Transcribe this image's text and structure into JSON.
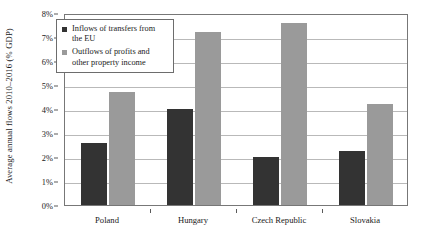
{
  "chart_data": {
    "type": "bar",
    "title": "",
    "xlabel": "",
    "ylabel": "Average annual flows 2010–2016 (% GDP)",
    "categories": [
      "Poland",
      "Hungary",
      "Czech Republic",
      "Slovakia"
    ],
    "series": [
      {
        "name": "Inflows of transfers from the EU",
        "color": "#333333",
        "values": [
          2.6,
          4.0,
          2.0,
          2.25
        ]
      },
      {
        "name": "Outflows of profits and other property income",
        "color": "#9a9a9a",
        "values": [
          4.7,
          7.2,
          7.6,
          4.2
        ]
      }
    ],
    "ylim": [
      0,
      8
    ],
    "ytick_values": [
      0,
      1,
      2,
      3,
      4,
      5,
      6,
      7,
      8
    ],
    "ytick_labels": [
      "0%",
      "1%",
      "2%",
      "3%",
      "4%",
      "5%",
      "6%",
      "7%",
      "8%"
    ],
    "grid": true,
    "legend_position": "upper left"
  },
  "legend": {
    "items": [
      {
        "label_line1": "Inflows of transfers from",
        "label_line2": "the EU"
      },
      {
        "label_line1": "Outflows of profits and",
        "label_line2": "other property income"
      }
    ]
  }
}
